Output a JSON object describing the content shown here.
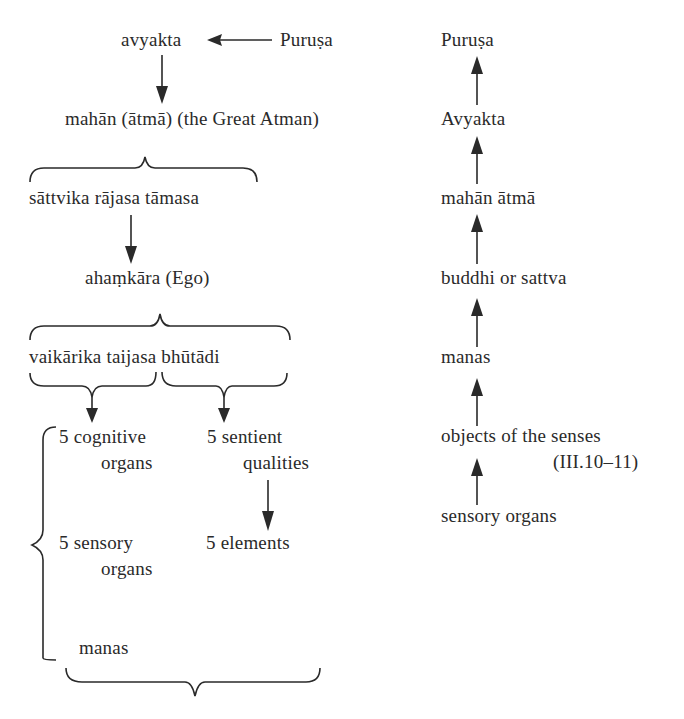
{
  "left_diagram": {
    "avyakta": "avyakta",
    "purusa": "Puruṣa",
    "mahan": "mahān (ātmā) (the Great Atman)",
    "gunas": "sāttvika rājasa tāmasa",
    "ahamkara": "ahaṃkāra (Ego)",
    "ego_types": "vaikārika taijasa bhūtādi",
    "cognitive_line1": "5 cognitive",
    "cognitive_line2": "organs",
    "sentient_line1": "5 sentient",
    "sentient_line2": "qualities",
    "sensory_line1": "5 sensory",
    "sensory_line2": "organs",
    "elements": "5 elements",
    "manas": "manas"
  },
  "right_diagram": {
    "items": [
      "Puruṣa",
      "Avyakta",
      "mahān ātmā",
      "buddhi or sattva",
      "manas",
      "objects of the senses",
      "sensory organs"
    ],
    "reference": "(III.10–11)"
  },
  "colors": {
    "ink": "#2a2a2a",
    "background": "#ffffff"
  }
}
